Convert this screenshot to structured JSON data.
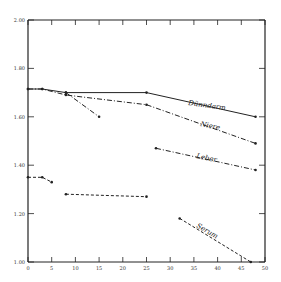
{
  "chart_data": {
    "type": "line",
    "title": "",
    "xlabel": "",
    "ylabel": "",
    "xlim": [
      0,
      50
    ],
    "ylim": [
      1.0,
      2.0
    ],
    "grid": false,
    "legend": "inline labels",
    "x_ticks": [
      "0",
      "5",
      "10",
      "15",
      "20",
      "25",
      "30",
      "35",
      "40",
      "45",
      "50"
    ],
    "y_ticks": [
      "1.00",
      "1.20",
      "1.40",
      "1.60",
      "1.80",
      "2.00"
    ],
    "series": [
      {
        "name": "Dünndarm",
        "style": "solid",
        "points": [
          [
            0,
            1.715
          ],
          [
            3,
            1.715
          ],
          [
            8,
            1.7
          ],
          [
            25,
            1.7
          ],
          [
            48,
            1.6
          ]
        ]
      },
      {
        "name": "Niere",
        "style": "dash-dot",
        "points": [
          [
            0,
            1.715
          ],
          [
            3,
            1.715
          ],
          [
            8,
            1.69
          ],
          [
            25,
            1.65
          ],
          [
            48,
            1.49
          ]
        ]
      },
      {
        "name": "Niere (Zweig)",
        "style": "dash-dot",
        "points": [
          [
            8,
            1.7
          ],
          [
            15,
            1.6
          ]
        ]
      },
      {
        "name": "Leber",
        "style": "dash-dot",
        "points": [
          [
            27,
            1.47
          ],
          [
            48,
            1.38
          ]
        ]
      },
      {
        "name": "Serum",
        "style": "dashed",
        "segments": [
          [
            [
              0,
              1.35
            ],
            [
              3,
              1.35
            ],
            [
              5,
              1.33
            ]
          ],
          [
            [
              8,
              1.28
            ],
            [
              25,
              1.27
            ]
          ],
          [
            [
              32,
              1.18
            ],
            [
              47,
              1.0
            ]
          ]
        ]
      }
    ]
  },
  "labels": {
    "duenndarm": "Dünndarm",
    "niere": "Niere",
    "leber": "Leber",
    "serum": "Serum"
  },
  "axis": {
    "x": [
      "0",
      "5",
      "10",
      "15",
      "20",
      "25",
      "30",
      "35",
      "40",
      "45",
      "50"
    ],
    "y": [
      "2.00",
      "1.80",
      "1.60",
      "1.40",
      "1.20",
      "1.00"
    ]
  }
}
